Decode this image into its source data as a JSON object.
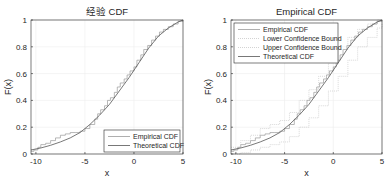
{
  "chart_data": [
    {
      "type": "line",
      "title": "经验 CDF",
      "xlabel": "x",
      "ylabel": "F(x)",
      "xlim": [
        -10.5,
        5
      ],
      "ylim": [
        0,
        1
      ],
      "xticks": [
        -10,
        -5,
        0,
        5
      ],
      "xtick_labels": [
        "-10",
        "-5",
        "0",
        "5"
      ],
      "yticks": [
        0,
        0.2,
        0.4,
        0.6,
        0.8,
        1
      ],
      "ytick_labels": [
        "0",
        "0.2",
        "0.4",
        "0.6",
        "0.8",
        "1"
      ],
      "grid": true,
      "legend_position": "southeast",
      "legend": [
        "Empirical CDF",
        "Theoretical CDF"
      ],
      "series": [
        {
          "name": "Empirical CDF",
          "style": "stairs",
          "color": "#9a9a9a",
          "x": [
            -10.5,
            -10.2,
            -9.8,
            -9.5,
            -9.0,
            -8.5,
            -8.0,
            -7.5,
            -7.0,
            -6.5,
            -6.0,
            -5.5,
            -5.0,
            -4.5,
            -4.0,
            -3.7,
            -3.4,
            -3.0,
            -2.7,
            -2.4,
            -2.0,
            -1.7,
            -1.4,
            -1.0,
            -0.7,
            -0.4,
            0.0,
            0.3,
            0.7,
            1.0,
            1.4,
            1.8,
            2.2,
            2.6,
            3.0,
            3.5,
            4.0,
            4.5,
            5.0
          ],
          "y": [
            0.02,
            0.03,
            0.05,
            0.07,
            0.08,
            0.1,
            0.12,
            0.14,
            0.15,
            0.16,
            0.16,
            0.17,
            0.19,
            0.22,
            0.26,
            0.3,
            0.33,
            0.36,
            0.4,
            0.42,
            0.46,
            0.5,
            0.53,
            0.56,
            0.59,
            0.62,
            0.65,
            0.7,
            0.74,
            0.78,
            0.81,
            0.85,
            0.88,
            0.91,
            0.93,
            0.95,
            0.97,
            0.99,
            1.0
          ]
        },
        {
          "name": "Theoretical CDF",
          "style": "line",
          "color": "#555555",
          "x": [
            -10.5,
            -9.5,
            -8.5,
            -7.5,
            -6.5,
            -5.5,
            -4.5,
            -3.5,
            -2.5,
            -1.5,
            -0.5,
            0.5,
            1.5,
            2.5,
            3.5,
            4.5,
            5.0
          ],
          "y": [
            0.03,
            0.045,
            0.065,
            0.09,
            0.12,
            0.16,
            0.22,
            0.29,
            0.37,
            0.47,
            0.57,
            0.68,
            0.79,
            0.88,
            0.94,
            0.985,
            1.0
          ]
        }
      ]
    },
    {
      "type": "line",
      "title": "Empirical CDF",
      "xlabel": "x",
      "ylabel": "F(x)",
      "xlim": [
        -10.5,
        5
      ],
      "ylim": [
        0,
        1
      ],
      "xticks": [
        -10,
        -5,
        0,
        5
      ],
      "xtick_labels": [
        "-10",
        "-5",
        "0",
        "5"
      ],
      "yticks": [
        0,
        0.2,
        0.4,
        0.6,
        0.8,
        1
      ],
      "ytick_labels": [
        "0",
        "0.2",
        "0.4",
        "0.6",
        "0.8",
        "1"
      ],
      "grid": true,
      "legend_position": "northwest",
      "legend": [
        "Empirical CDF",
        "Lower Confidence Bound",
        "Upper Confidence Bound",
        "Theoretical CDF"
      ],
      "series": [
        {
          "name": "Empirical CDF",
          "style": "stairs",
          "color": "#9a9a9a",
          "x": [
            -10.5,
            -10.2,
            -9.8,
            -9.5,
            -9.0,
            -8.5,
            -8.0,
            -7.5,
            -7.0,
            -6.5,
            -6.0,
            -5.5,
            -5.0,
            -4.5,
            -4.0,
            -3.7,
            -3.4,
            -3.0,
            -2.7,
            -2.4,
            -2.0,
            -1.7,
            -1.4,
            -1.0,
            -0.7,
            -0.4,
            0.0,
            0.3,
            0.7,
            1.0,
            1.4,
            1.8,
            2.2,
            2.6,
            3.0,
            3.5,
            4.0,
            4.5,
            5.0
          ],
          "y": [
            0.02,
            0.03,
            0.05,
            0.07,
            0.08,
            0.1,
            0.12,
            0.14,
            0.15,
            0.16,
            0.16,
            0.17,
            0.19,
            0.22,
            0.26,
            0.3,
            0.33,
            0.36,
            0.4,
            0.42,
            0.46,
            0.5,
            0.53,
            0.56,
            0.59,
            0.62,
            0.65,
            0.7,
            0.74,
            0.78,
            0.81,
            0.85,
            0.88,
            0.91,
            0.93,
            0.95,
            0.97,
            0.99,
            1.0
          ]
        },
        {
          "name": "Lower Confidence Bound",
          "style": "stairs-dotted",
          "color": "#c8c8c8",
          "x": [
            -10.5,
            -9.5,
            -8.5,
            -7.5,
            -6.5,
            -5.5,
            -4.5,
            -3.5,
            -2.5,
            -1.5,
            -0.5,
            0.5,
            1.5,
            2.5,
            3.5,
            4.5,
            5.0
          ],
          "y": [
            0.0,
            0.01,
            0.03,
            0.05,
            0.07,
            0.09,
            0.13,
            0.2,
            0.27,
            0.36,
            0.47,
            0.58,
            0.7,
            0.8,
            0.87,
            0.94,
            0.97
          ]
        },
        {
          "name": "Upper Confidence Bound",
          "style": "stairs-dotted",
          "color": "#c8c8c8",
          "x": [
            -10.5,
            -9.5,
            -8.5,
            -7.5,
            -6.5,
            -5.5,
            -4.5,
            -3.5,
            -2.5,
            -1.5,
            -0.5,
            0.5,
            1.5,
            2.5,
            3.5,
            4.5,
            5.0
          ],
          "y": [
            0.05,
            0.1,
            0.14,
            0.19,
            0.22,
            0.25,
            0.31,
            0.4,
            0.48,
            0.58,
            0.68,
            0.78,
            0.87,
            0.93,
            0.97,
            1.0,
            1.0
          ]
        },
        {
          "name": "Theoretical CDF",
          "style": "line",
          "color": "#555555",
          "x": [
            -10.5,
            -9.5,
            -8.5,
            -7.5,
            -6.5,
            -5.5,
            -4.5,
            -3.5,
            -2.5,
            -1.5,
            -0.5,
            0.5,
            1.5,
            2.5,
            3.5,
            4.5,
            5.0
          ],
          "y": [
            0.03,
            0.045,
            0.065,
            0.09,
            0.12,
            0.16,
            0.22,
            0.29,
            0.37,
            0.47,
            0.57,
            0.68,
            0.79,
            0.88,
            0.94,
            0.985,
            1.0
          ]
        }
      ]
    }
  ]
}
